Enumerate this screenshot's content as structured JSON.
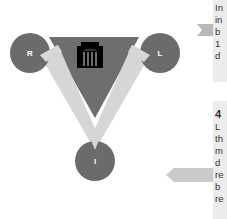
{
  "diagram": {
    "nodes": [
      {
        "id": "R",
        "label": "R"
      },
      {
        "id": "L",
        "label": "L"
      },
      {
        "id": "I",
        "label": "I"
      }
    ],
    "center_icon": "building-icon",
    "colors": {
      "dark_triangle": "#6e6e6e",
      "light_v": "#d6d6d6",
      "circle": "#6b6b6b",
      "icon": "#000000",
      "panel_bg": "#ececec",
      "arrow": "#c8c8c8"
    }
  },
  "panels": [
    {
      "heading": "",
      "lines": [
        "In",
        "in",
        "b",
        "1",
        "d"
      ]
    },
    {
      "heading": "4",
      "lines": [
        "L",
        "th",
        "m",
        "d",
        "re",
        "b",
        "re"
      ]
    }
  ]
}
